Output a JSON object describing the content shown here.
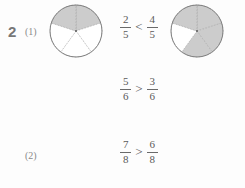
{
  "worksheet": {
    "question_number": "2",
    "figure_fill_color": "#cccccc",
    "figure_stroke_color": "#808080",
    "divider_color": "#9a9a9a",
    "text_color": "#5a5a5a",
    "background_color": "#fdfdfd",
    "rows": [
      {
        "label": "(1)",
        "shape": "circle",
        "total_parts": 5,
        "left_figure": {
          "shaded_parts": 2,
          "total_parts": 5,
          "shaded_indices": [
            0,
            4
          ]
        },
        "right_figure": {
          "shaded_parts": 4,
          "total_parts": 5,
          "shaded_indices": [
            0,
            1,
            2,
            4
          ]
        },
        "comparison": {
          "left_fraction": {
            "numerator": "2",
            "denominator": "5"
          },
          "operator": "<",
          "right_fraction": {
            "numerator": "4",
            "denominator": "5"
          }
        }
      },
      {
        "label": "(2)",
        "shape": "triangle",
        "total_parts": 6,
        "left_figure": {
          "shaded_parts": 5,
          "total_parts": 6,
          "shaded_indices": [
            0,
            1,
            2,
            3,
            5
          ]
        },
        "right_figure": {
          "shaded_parts": 3,
          "total_parts": 6,
          "shaded_indices": [
            0,
            1,
            5
          ]
        },
        "comparison": {
          "left_fraction": {
            "numerator": "5",
            "denominator": "6"
          },
          "operator": ">",
          "right_fraction": {
            "numerator": "3",
            "denominator": "6"
          }
        }
      },
      {
        "label": "(3)",
        "shape": "octagon",
        "total_parts": 8,
        "left_figure": {
          "shaded_parts": 7,
          "total_parts": 8,
          "shaded_indices": [
            0,
            1,
            2,
            3,
            5,
            6,
            7
          ]
        },
        "right_figure": {
          "shaded_parts": 6,
          "total_parts": 8,
          "shaded_indices": [
            0,
            1,
            2,
            3,
            6,
            7
          ]
        },
        "comparison": {
          "left_fraction": {
            "numerator": "7",
            "denominator": "8"
          },
          "operator": ">",
          "right_fraction": {
            "numerator": "6",
            "denominator": "8"
          }
        }
      }
    ]
  }
}
